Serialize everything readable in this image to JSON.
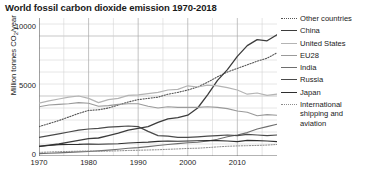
{
  "title": "World fossil carbon dioxide emission 1970-2018",
  "axes": {
    "ylabel_pre": "Million tonnes CO",
    "ylabel_sub": "2",
    "ylabel_post": "/year",
    "yticks": [
      "10000",
      "5000",
      "0"
    ],
    "xticks": [
      "1970",
      "1980",
      "1990",
      "2000",
      "2010"
    ]
  },
  "legend": [
    {
      "label": "Other countries",
      "color": "#555555",
      "style": "dotted",
      "width": 1.1
    },
    {
      "label": "China",
      "color": "#3c3c3c",
      "style": "solid",
      "width": 1.3
    },
    {
      "label": "United States",
      "color": "#b4b4b4",
      "style": "solid",
      "width": 1.2
    },
    {
      "label": "EU28",
      "color": "#9a9a9a",
      "style": "solid",
      "width": 1.1
    },
    {
      "label": "India",
      "color": "#6e6e6e",
      "style": "solid",
      "width": 1.1
    },
    {
      "label": "Russia",
      "color": "#4a4a4a",
      "style": "solid",
      "width": 1.2
    },
    {
      "label": "Japan",
      "color": "#2e2e2e",
      "style": "solid",
      "width": 1.1
    },
    {
      "label": "International shipping and aviation",
      "color": "#8c8c8c",
      "style": "dotted",
      "width": 1.0
    }
  ],
  "chart_data": {
    "type": "line",
    "title": "World fossil carbon dioxide emission 1970-2018",
    "xlabel": "",
    "ylabel": "Million tonnes CO2/year",
    "xlim": [
      1970,
      2018
    ],
    "ylim": [
      0,
      11500
    ],
    "yticks": [
      0,
      5000,
      10000
    ],
    "xticks": [
      1970,
      1980,
      1990,
      2000,
      2010
    ],
    "grid": "both-minor-1000-and-5-year-vertical",
    "legend_position": "right-outside",
    "x": [
      1970,
      1972,
      1974,
      1976,
      1978,
      1980,
      1982,
      1984,
      1986,
      1988,
      1990,
      1992,
      1994,
      1996,
      1998,
      2000,
      2002,
      2004,
      2006,
      2008,
      2010,
      2012,
      2014,
      2016,
      2018
    ],
    "series": [
      {
        "name": "Other countries",
        "values": [
          2450,
          2700,
          2950,
          3250,
          3550,
          3800,
          3850,
          4000,
          4250,
          4500,
          4700,
          4800,
          4900,
          5150,
          5300,
          5500,
          5750,
          6150,
          6600,
          7000,
          7300,
          7600,
          7900,
          8150,
          8600
        ]
      },
      {
        "name": "China",
        "values": [
          800,
          900,
          1000,
          1150,
          1300,
          1450,
          1500,
          1700,
          1900,
          2150,
          2300,
          2450,
          2800,
          3100,
          3200,
          3400,
          4000,
          5100,
          6300,
          7200,
          8300,
          9200,
          9700,
          9600,
          10100
        ]
      },
      {
        "name": "United States",
        "values": [
          4400,
          4600,
          4750,
          4900,
          5000,
          4800,
          4450,
          4700,
          4800,
          5050,
          5100,
          5200,
          5300,
          5500,
          5550,
          5850,
          5750,
          5900,
          5850,
          5700,
          5500,
          5150,
          5250,
          5050,
          5150
        ]
      },
      {
        "name": "EU28",
        "values": [
          4100,
          4250,
          4300,
          4350,
          4450,
          4400,
          4150,
          4200,
          4300,
          4350,
          4350,
          4150,
          4000,
          4100,
          4050,
          4050,
          4050,
          4100,
          4050,
          3950,
          3750,
          3650,
          3350,
          3450,
          3400
        ]
      },
      {
        "name": "India",
        "values": [
          200,
          230,
          260,
          300,
          340,
          380,
          430,
          490,
          560,
          640,
          700,
          780,
          870,
          960,
          1030,
          1100,
          1150,
          1250,
          1400,
          1600,
          1750,
          1950,
          2250,
          2450,
          2650
        ]
      },
      {
        "name": "Russia",
        "values": [
          1550,
          1700,
          1850,
          2000,
          2150,
          2250,
          2300,
          2400,
          2450,
          2500,
          2450,
          2050,
          1700,
          1650,
          1550,
          1550,
          1600,
          1650,
          1700,
          1750,
          1700,
          1800,
          1750,
          1700,
          1750
        ]
      },
      {
        "name": "Japan",
        "values": [
          800,
          880,
          950,
          960,
          970,
          1000,
          980,
          1000,
          1020,
          1080,
          1120,
          1160,
          1220,
          1250,
          1230,
          1250,
          1270,
          1280,
          1280,
          1250,
          1200,
          1300,
          1280,
          1250,
          1200
        ]
      },
      {
        "name": "International shipping and aviation",
        "values": [
          300,
          330,
          360,
          380,
          400,
          420,
          400,
          410,
          430,
          460,
          480,
          500,
          520,
          560,
          590,
          630,
          650,
          700,
          760,
          810,
          840,
          860,
          880,
          910,
          960
        ]
      }
    ]
  }
}
